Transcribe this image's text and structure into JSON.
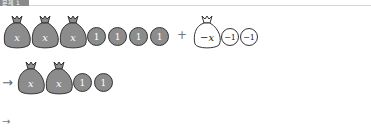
{
  "header": {
    "tag_label": "문제 1"
  },
  "diagram": {
    "row1": {
      "left_group": {
        "bags": [
          {
            "label": "x"
          },
          {
            "label": "x"
          },
          {
            "label": "x"
          }
        ],
        "coins": [
          {
            "label": "1"
          },
          {
            "label": "1"
          },
          {
            "label": "1"
          },
          {
            "label": "1"
          }
        ]
      },
      "operator": "+",
      "right_group": {
        "bags": [
          {
            "label": "−x"
          }
        ],
        "coins": [
          {
            "label": "−1"
          },
          {
            "label": "−1"
          }
        ]
      }
    },
    "row2": {
      "arrow": "→",
      "bags": [
        {
          "label": "x"
        },
        {
          "label": "x"
        }
      ],
      "coins": [
        {
          "label": "1"
        },
        {
          "label": "1"
        }
      ]
    },
    "row3": {
      "arrow": "→"
    }
  },
  "colors": {
    "filled": "#8c8c8c",
    "outline": "#333333",
    "empty": "#ffffff"
  }
}
